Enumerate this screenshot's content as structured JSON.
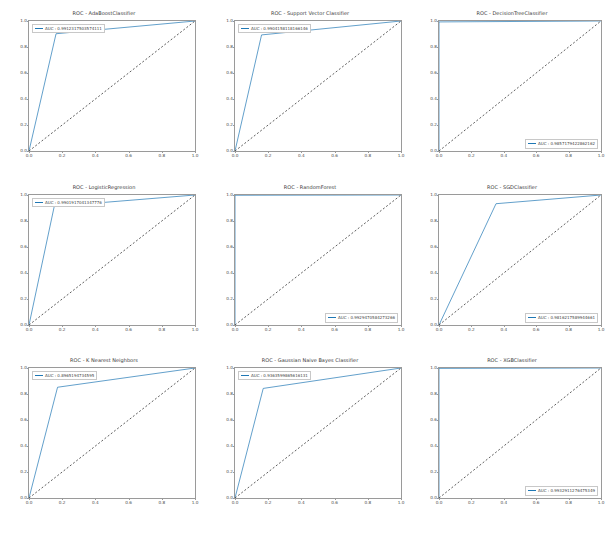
{
  "figure": {
    "background": "#ffffff",
    "rows": 3,
    "cols": 3,
    "curve_color": "#1f77b4",
    "chance_color": "#1a1a1a"
  },
  "axis": {
    "xticks": [
      "0.0",
      "0.2",
      "0.4",
      "0.6",
      "0.8",
      "1.0"
    ],
    "yticks": [
      "0.0",
      "0.2",
      "0.4",
      "0.6",
      "0.8",
      "1.0"
    ],
    "xlim": [
      0.0,
      1.0
    ],
    "ylim": [
      0.0,
      1.0
    ]
  },
  "chart_data": [
    {
      "type": "line",
      "title": "ROC  -  AdaBoostClassifier",
      "xlabel": "",
      "ylabel": "",
      "xlim": [
        0.0,
        1.0
      ],
      "ylim": [
        0.0,
        1.0
      ],
      "grid": false,
      "legend_position": "upper left",
      "legend_label": "AUC : 0.9912317503574111",
      "series": [
        {
          "name": "ROC curve",
          "style": "solid",
          "x": [
            0.0,
            0.163,
            1.0
          ],
          "y": [
            0.0,
            0.902,
            1.0
          ]
        },
        {
          "name": "chance",
          "style": "dashed",
          "x": [
            0.0,
            1.0
          ],
          "y": [
            0.0,
            1.0
          ]
        }
      ]
    },
    {
      "type": "line",
      "title": "ROC  -  Support Vector Classifier",
      "xlabel": "",
      "ylabel": "",
      "xlim": [
        0.0,
        1.0
      ],
      "ylim": [
        0.0,
        1.0
      ],
      "grid": false,
      "legend_position": "upper left",
      "legend_label": "AUC : 0.9904158118166146",
      "series": [
        {
          "name": "ROC curve",
          "style": "solid",
          "x": [
            0.0,
            0.16,
            1.0
          ],
          "y": [
            0.0,
            0.893,
            1.0
          ]
        },
        {
          "name": "chance",
          "style": "dashed",
          "x": [
            0.0,
            1.0
          ],
          "y": [
            0.0,
            1.0
          ]
        }
      ]
    },
    {
      "type": "line",
      "title": "ROC  -  DecisionTreeClassifier",
      "xlabel": "",
      "ylabel": "",
      "xlim": [
        0.0,
        1.0
      ],
      "ylim": [
        0.0,
        1.0
      ],
      "grid": false,
      "legend_position": "lower right",
      "legend_label": "AUC : 0.9857179422862162",
      "series": [
        {
          "name": "ROC curve",
          "style": "solid",
          "x": [
            0.0,
            0.0,
            1.0
          ],
          "y": [
            0.0,
            0.993,
            1.0
          ]
        },
        {
          "name": "chance",
          "style": "dashed",
          "x": [
            0.0,
            1.0
          ],
          "y": [
            0.0,
            1.0
          ]
        }
      ]
    },
    {
      "type": "line",
      "title": "ROC  -  LogisticRegression",
      "xlabel": "",
      "ylabel": "",
      "xlim": [
        0.0,
        1.0
      ],
      "ylim": [
        0.0,
        1.0
      ],
      "grid": false,
      "legend_position": "upper left",
      "legend_label": "AUC : 0.9901917041347776",
      "series": [
        {
          "name": "ROC curve",
          "style": "solid",
          "x": [
            0.0,
            0.152,
            1.0
          ],
          "y": [
            0.0,
            0.912,
            1.0
          ]
        },
        {
          "name": "chance",
          "style": "dashed",
          "x": [
            0.0,
            1.0
          ],
          "y": [
            0.0,
            1.0
          ]
        }
      ]
    },
    {
      "type": "line",
      "title": "ROC  -  RandomForest",
      "xlabel": "",
      "ylabel": "",
      "xlim": [
        0.0,
        1.0
      ],
      "ylim": [
        0.0,
        1.0
      ],
      "grid": false,
      "legend_position": "lower right",
      "legend_label": "AUC : 0.9929470584273266",
      "series": [
        {
          "name": "ROC curve",
          "style": "solid",
          "x": [
            0.0,
            0.0,
            1.0
          ],
          "y": [
            0.0,
            0.998,
            1.0
          ]
        },
        {
          "name": "chance",
          "style": "dashed",
          "x": [
            0.0,
            1.0
          ],
          "y": [
            0.0,
            1.0
          ]
        }
      ]
    },
    {
      "type": "line",
      "title": "ROC  -  SGDClassifier",
      "xlabel": "",
      "ylabel": "",
      "xlim": [
        0.0,
        1.0
      ],
      "ylim": [
        0.0,
        1.0
      ],
      "grid": false,
      "legend_position": "lower right",
      "legend_label": "AUC : 0.9816217589944661",
      "series": [
        {
          "name": "ROC curve",
          "style": "solid",
          "x": [
            0.0,
            0.352,
            1.0
          ],
          "y": [
            0.0,
            0.933,
            1.0
          ]
        },
        {
          "name": "chance",
          "style": "dashed",
          "x": [
            0.0,
            1.0
          ],
          "y": [
            0.0,
            1.0
          ]
        }
      ]
    },
    {
      "type": "line",
      "title": "ROC  -  K Nearest Neighbors",
      "xlabel": "",
      "ylabel": "",
      "xlim": [
        0.0,
        1.0
      ],
      "ylim": [
        0.0,
        1.0
      ],
      "grid": false,
      "legend_position": "upper left",
      "legend_label": "AUC : 0.8965194734595",
      "series": [
        {
          "name": "ROC curve",
          "style": "solid",
          "x": [
            0.0,
            0.172,
            1.0
          ],
          "y": [
            0.0,
            0.852,
            1.0
          ]
        },
        {
          "name": "chance",
          "style": "dashed",
          "x": [
            0.0,
            1.0
          ],
          "y": [
            0.0,
            1.0
          ]
        }
      ]
    },
    {
      "type": "line",
      "title": "ROC  -  Gaussian Naive Bayes Classifier",
      "xlabel": "",
      "ylabel": "",
      "xlim": [
        0.0,
        1.0
      ],
      "ylim": [
        0.0,
        1.0
      ],
      "grid": false,
      "legend_position": "upper left",
      "legend_label": "AUC : 0.9363599865616131",
      "series": [
        {
          "name": "ROC curve",
          "style": "solid",
          "x": [
            0.0,
            0.17,
            1.0
          ],
          "y": [
            0.0,
            0.843,
            1.0
          ]
        },
        {
          "name": "chance",
          "style": "dashed",
          "x": [
            0.0,
            1.0
          ],
          "y": [
            0.0,
            1.0
          ]
        }
      ]
    },
    {
      "type": "line",
      "title": "ROC  -  XGBClassifier",
      "xlabel": "",
      "ylabel": "",
      "xlim": [
        0.0,
        1.0
      ],
      "ylim": [
        0.0,
        1.0
      ],
      "grid": false,
      "legend_position": "lower right",
      "legend_label": "AUC : 0.9932911276475349",
      "series": [
        {
          "name": "ROC curve",
          "style": "solid",
          "x": [
            0.0,
            0.0,
            1.0
          ],
          "y": [
            0.0,
            0.997,
            1.0
          ]
        },
        {
          "name": "chance",
          "style": "dashed",
          "x": [
            0.0,
            1.0
          ],
          "y": [
            0.0,
            1.0
          ]
        }
      ]
    }
  ]
}
